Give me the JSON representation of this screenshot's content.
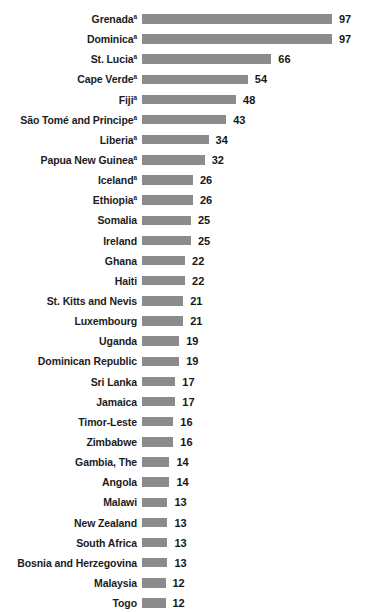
{
  "chart_data": {
    "type": "bar",
    "orientation": "horizontal",
    "title": "",
    "xlabel": "",
    "ylabel": "",
    "xlim": [
      0,
      97
    ],
    "grid": false,
    "legend": null,
    "footnote_marker": "a",
    "categories": [
      "Grenada",
      "Dominica",
      "St. Lucia",
      "Cape Verde",
      "Fiji",
      "São Tomé and Principe",
      "Liberia",
      "Papua New Guinea",
      "Iceland",
      "Ethiopia",
      "Somalia",
      "Ireland",
      "Ghana",
      "Haiti",
      "St. Kitts and Nevis",
      "Luxembourg",
      "Uganda",
      "Dominican Republic",
      "Sri Lanka",
      "Jamaica",
      "Timor-Leste",
      "Zimbabwe",
      "Gambia, The",
      "Angola",
      "Malawi",
      "New Zealand",
      "South Africa",
      "Bosnia and Herzegovina",
      "Malaysia",
      "Togo"
    ],
    "values": [
      97,
      97,
      66,
      54,
      48,
      43,
      34,
      32,
      26,
      26,
      25,
      25,
      22,
      22,
      21,
      21,
      19,
      19,
      17,
      17,
      16,
      16,
      14,
      14,
      13,
      13,
      13,
      13,
      12,
      12
    ],
    "marked": [
      true,
      true,
      true,
      true,
      true,
      true,
      true,
      true,
      true,
      true,
      false,
      false,
      false,
      false,
      false,
      false,
      false,
      false,
      false,
      false,
      false,
      false,
      false,
      false,
      false,
      false,
      false,
      false,
      false,
      false
    ]
  },
  "style": {
    "bar_color": "#8b8b8b",
    "label_color": "#1c1c1c",
    "value_color": "#171717",
    "background": "#ffffff"
  },
  "cropped_header_text": ""
}
